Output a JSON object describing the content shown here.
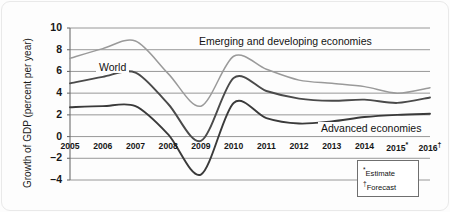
{
  "chart_data": {
    "type": "line",
    "title": "",
    "xlabel": "",
    "ylabel": "Growth of GDP (percent per year)",
    "ylim": [
      -4,
      10
    ],
    "yticks": [
      10,
      8,
      6,
      4,
      2,
      0,
      -2,
      -4
    ],
    "ytick_labels": [
      "10",
      "8",
      "6",
      "4",
      "2",
      "0",
      "–2",
      "–4"
    ],
    "grid": true,
    "legend_position": "inline-annotations",
    "categories": [
      "2005",
      "2006",
      "2007",
      "2008",
      "2009",
      "2010",
      "2011",
      "2012",
      "2013",
      "2014",
      "2015",
      "2016"
    ],
    "xtick_labels": [
      "2005",
      "2006",
      "2007",
      "2008",
      "2009",
      "2010",
      "2011",
      "2012",
      "2013",
      "2014",
      "2015*",
      "2016†"
    ],
    "series": [
      {
        "name": "Emerging and developing economies",
        "color": "#9a9a9a",
        "values": [
          7.2,
          8.1,
          8.8,
          5.8,
          2.8,
          7.4,
          6.2,
          5.2,
          4.9,
          4.6,
          4.0,
          4.5
        ]
      },
      {
        "name": "World",
        "color": "#4a4a4a",
        "values": [
          4.9,
          5.5,
          5.9,
          3.0,
          -0.4,
          5.4,
          4.2,
          3.5,
          3.3,
          3.4,
          3.1,
          3.6
        ]
      },
      {
        "name": "Advanced economies",
        "color": "#3a3a3a",
        "values": [
          2.7,
          2.8,
          2.8,
          0.2,
          -3.5,
          3.1,
          1.7,
          1.2,
          1.4,
          1.8,
          2.0,
          2.1
        ]
      }
    ],
    "annotations": [
      {
        "id": "emerging-label",
        "text": "Emerging and developing economies"
      },
      {
        "id": "world-label",
        "text": "World"
      },
      {
        "id": "advanced-label",
        "text": "Advanced economies"
      }
    ],
    "footnotes": [
      {
        "marker": "*",
        "text": "Estimate"
      },
      {
        "marker": "†",
        "text": "Forecast"
      }
    ]
  }
}
